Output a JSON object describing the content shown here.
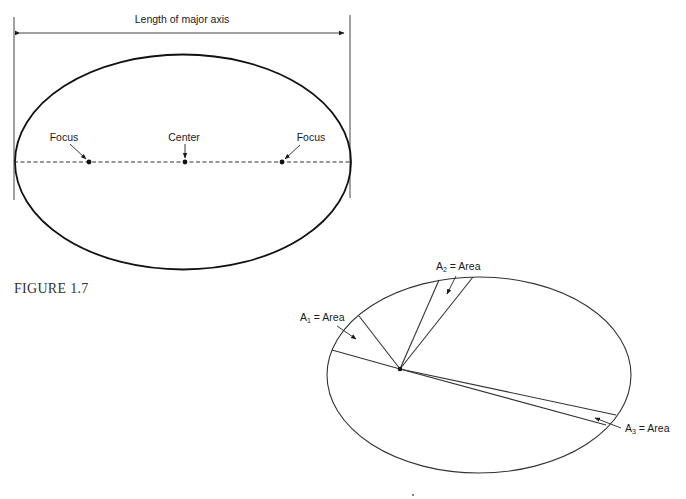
{
  "figure1": {
    "dimension_label": "Length of major axis",
    "labels": {
      "focus_left": "Focus",
      "center": "Center",
      "focus_right": "Focus"
    }
  },
  "caption": "FIGURE 1.7",
  "figure2": {
    "area_labels": [
      {
        "prefix": "A",
        "sub": "1",
        "suffix": " = Area"
      },
      {
        "prefix": "A",
        "sub": "2",
        "suffix": " = Area"
      },
      {
        "prefix": "A",
        "sub": "3",
        "suffix": " = Area"
      }
    ]
  },
  "colors": {
    "stroke": "#1a1a1a",
    "thin_stroke": "#333333",
    "background": "#ffffff"
  }
}
